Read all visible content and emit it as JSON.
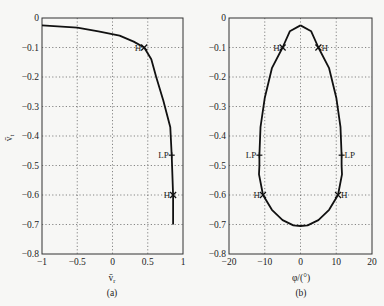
{
  "chart_data": [
    {
      "panel": "(a)",
      "type": "line",
      "title": "",
      "xlabel": "v̄_r",
      "ylabel": "v̄_t",
      "xlim": [
        -1,
        1
      ],
      "ylim": [
        -0.8,
        0
      ],
      "grid": true,
      "xticks": [
        "-1",
        "-0.5",
        "0",
        "0.5",
        "1"
      ],
      "yticks": [
        "0",
        "-0.1",
        "-0.2",
        "-0.3",
        "-0.4",
        "-0.5",
        "-0.6",
        "-0.7",
        "-0.8"
      ],
      "series": [
        {
          "name": "branch",
          "x": [
            -1.0,
            -0.5,
            -0.2,
            0.1,
            0.3,
            0.45,
            0.55,
            0.62,
            0.72,
            0.82,
            0.84,
            0.86,
            0.86
          ],
          "y": [
            -0.025,
            -0.033,
            -0.045,
            -0.06,
            -0.08,
            -0.1,
            -0.14,
            -0.2,
            -0.28,
            -0.37,
            -0.465,
            -0.6,
            -0.7
          ]
        }
      ],
      "annotations": [
        {
          "label": "H",
          "x": 0.45,
          "y": -0.1,
          "marker": "x"
        },
        {
          "label": "LP",
          "x": 0.84,
          "y": -0.465,
          "marker": "+"
        },
        {
          "label": "H",
          "x": 0.86,
          "y": -0.6,
          "marker": "x"
        }
      ]
    },
    {
      "panel": "(b)",
      "type": "line",
      "title": "",
      "xlabel": "φ/(°)",
      "ylabel": "",
      "xlim": [
        -20,
        20
      ],
      "ylim": [
        -0.8,
        0
      ],
      "grid": true,
      "xticks": [
        "-20",
        "-10",
        "0",
        "10",
        "20"
      ],
      "yticks": [
        "0",
        "-0.1",
        "-0.2",
        "-0.3",
        "-0.4",
        "-0.5",
        "-0.6",
        "-0.7",
        "-0.8"
      ],
      "series": [
        {
          "name": "closed branch",
          "x": [
            0,
            3,
            5,
            8,
            10,
            11.2,
            11.5,
            11.5,
            11.6,
            10.5,
            8,
            5,
            2,
            0,
            -2,
            -5,
            -8,
            -10.5,
            -11.6,
            -11.5,
            -11.5,
            -11.2,
            -10,
            -8,
            -5,
            -3,
            0
          ],
          "y": [
            -0.025,
            -0.045,
            -0.1,
            -0.17,
            -0.27,
            -0.37,
            -0.465,
            -0.5,
            -0.53,
            -0.6,
            -0.65,
            -0.685,
            -0.703,
            -0.705,
            -0.703,
            -0.685,
            -0.65,
            -0.6,
            -0.53,
            -0.5,
            -0.465,
            -0.37,
            -0.27,
            -0.17,
            -0.1,
            -0.045,
            -0.025
          ]
        }
      ],
      "annotations": [
        {
          "label": "H",
          "x": -5,
          "y": -0.1,
          "marker": "x"
        },
        {
          "label": "H",
          "x": 5,
          "y": -0.1,
          "marker": "x"
        },
        {
          "label": "LP",
          "x": -11.5,
          "y": -0.465,
          "marker": "+"
        },
        {
          "label": "LP",
          "x": 11.5,
          "y": -0.465,
          "marker": "+"
        },
        {
          "label": "H",
          "x": -10.5,
          "y": -0.6,
          "marker": "x"
        },
        {
          "label": "H",
          "x": 10.5,
          "y": -0.6,
          "marker": "x"
        }
      ]
    }
  ],
  "labels": {
    "a_xlabel": "v̄",
    "a_xlabel_sub": "r",
    "a_ylabel": "v̄",
    "a_ylabel_sub": "t",
    "a_caption": "(a)",
    "b_xlabel": "φ/(°)",
    "b_caption": "(b)"
  }
}
